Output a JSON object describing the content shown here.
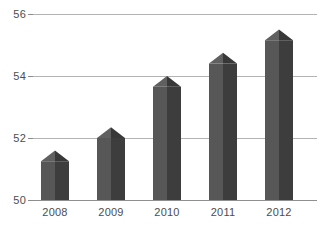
{
  "chart_data": {
    "type": "bar",
    "title": "",
    "subtitle": "",
    "xlabel": "",
    "ylabel": "",
    "categories": [
      "2008",
      "2009",
      "2010",
      "2011",
      "2012"
    ],
    "values": [
      51.6,
      52.35,
      54.0,
      54.75,
      55.5
    ],
    "series": [
      {
        "name": "",
        "values": [
          51.6,
          52.35,
          54.0,
          54.75,
          55.5
        ]
      }
    ],
    "ylim": [
      50,
      56
    ],
    "y_ticks": [
      50,
      52,
      54,
      56
    ],
    "y_tick_labels": [
      "50",
      "52",
      "54",
      "56"
    ],
    "x_tick_labels": [
      "2008",
      "2009",
      "2010",
      "2011",
      "2012"
    ],
    "grid": true,
    "grid_axis": "y",
    "legend": false,
    "legend_position": "none",
    "bar_style": "3d-pyramid",
    "colors": {
      "bar_left_face": "#575757",
      "bar_right_face": "#3d3d3d",
      "bar_apex_left": "#606060",
      "bar_apex_right": "#383838",
      "gridline": "#b3b3b3",
      "axis": "#8f8f8f",
      "tick_text": "#4d4d4d",
      "background": "#ffffff"
    },
    "annotations": []
  },
  "axis": {
    "y_labels": [
      {
        "value": "56",
        "y": 14
      },
      {
        "value": "54",
        "y": 76
      },
      {
        "value": "52",
        "y": 138
      },
      {
        "value": "50",
        "y": 200
      }
    ],
    "x_labels": [
      {
        "value": "2008",
        "x": 28
      },
      {
        "value": "2009",
        "x": 84
      },
      {
        "value": "2010",
        "x": 140
      },
      {
        "value": "2011",
        "x": 196
      },
      {
        "value": "2012",
        "x": 252
      }
    ]
  }
}
